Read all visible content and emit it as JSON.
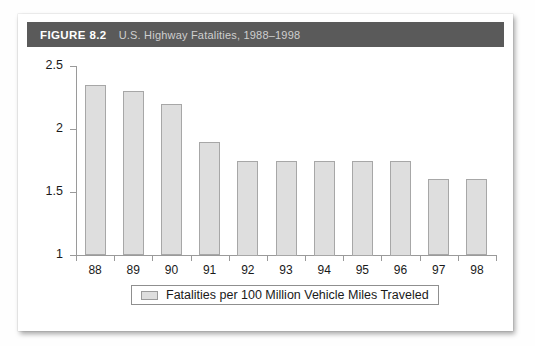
{
  "figure": {
    "number_label": "FIGURE 8.2",
    "title": "U.S. Highway Fatalities, 1988–1998"
  },
  "legend": {
    "entries": [
      {
        "label": "Fatalities per 100 Million Vehicle Miles Traveled",
        "color": "#dedede"
      }
    ]
  },
  "colors": {
    "header_bar": "#5a5a5a",
    "header_number_text": "#ffffff",
    "header_title_text": "#cfcfcf",
    "bar_fill": "#dedede",
    "bar_border": "#a7a7a7",
    "axis_line": "#9a9a9a",
    "card_background": "#ffffff"
  },
  "chart_data": {
    "type": "bar",
    "title": "U.S. Highway Fatalities, 1988–1998",
    "xlabel": "",
    "ylabel": "",
    "categories": [
      "88",
      "89",
      "90",
      "91",
      "92",
      "93",
      "94",
      "95",
      "96",
      "97",
      "98"
    ],
    "values": [
      2.35,
      2.3,
      2.2,
      1.9,
      1.75,
      1.75,
      1.75,
      1.75,
      1.75,
      1.6,
      1.6
    ],
    "series": [
      {
        "name": "Fatalities per 100 Million Vehicle Miles Traveled",
        "values": [
          2.35,
          2.3,
          2.2,
          1.9,
          1.75,
          1.75,
          1.75,
          1.75,
          1.75,
          1.6,
          1.6
        ]
      }
    ],
    "ylim": [
      1,
      2.5
    ],
    "yticks": [
      1,
      1.5,
      2,
      2.5
    ],
    "ytick_labels": [
      "1",
      "1.5",
      "2",
      "2.5"
    ],
    "grid": false,
    "legend_position": "bottom"
  }
}
